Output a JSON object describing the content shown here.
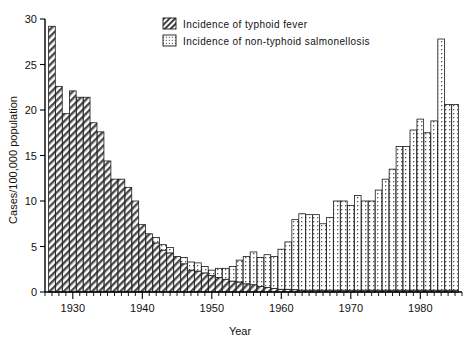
{
  "chart_data": {
    "type": "bar",
    "title": "",
    "subtitle": "",
    "xlabel": "Year",
    "ylabel": "Cases/100,000 population",
    "stacked": true,
    "grid": false,
    "legend_position": "top-center",
    "xlim": [
      1926,
      1986
    ],
    "ylim": [
      0,
      30
    ],
    "ytick_labels": [
      "0",
      "5",
      "10",
      "15",
      "20",
      "25",
      "30"
    ],
    "yticks": [
      0,
      5,
      10,
      15,
      20,
      25,
      30
    ],
    "xtick_labels": [
      "1930",
      "1940",
      "1950",
      "1960",
      "1970",
      "1980"
    ],
    "xticks": [
      1930,
      1940,
      1950,
      1960,
      1970,
      1980
    ],
    "x": [
      1927,
      1928,
      1929,
      1930,
      1931,
      1932,
      1933,
      1934,
      1935,
      1936,
      1937,
      1938,
      1939,
      1940,
      1941,
      1942,
      1943,
      1944,
      1945,
      1946,
      1947,
      1948,
      1949,
      1950,
      1951,
      1952,
      1953,
      1954,
      1955,
      1956,
      1957,
      1958,
      1959,
      1960,
      1961,
      1962,
      1963,
      1964,
      1965,
      1966,
      1967,
      1968,
      1969,
      1970,
      1971,
      1972,
      1973,
      1974,
      1975,
      1976,
      1977,
      1978,
      1979,
      1980,
      1981,
      1982,
      1983,
      1984,
      1985
    ],
    "series": [
      {
        "name": "Incidence of typhoid fever",
        "pattern": "diagonal-hatch",
        "values": [
          29.2,
          22.6,
          19.6,
          22.1,
          21.4,
          21.4,
          18.6,
          17.6,
          14.4,
          12.4,
          12.4,
          11.5,
          10.0,
          7.4,
          6.4,
          5.4,
          4.6,
          4.3,
          3.9,
          3.1,
          2.4,
          2.3,
          2.1,
          1.8,
          1.6,
          1.4,
          1.2,
          1.1,
          0.9,
          0.8,
          0.6,
          0.5,
          0.4,
          0.3,
          0.3,
          0.25,
          0.2,
          0.2,
          0.2,
          0.2,
          0.2,
          0.2,
          0.2,
          0.2,
          0.2,
          0.2,
          0.2,
          0.2,
          0.2,
          0.2,
          0.2,
          0.2,
          0.2,
          0.2,
          0.2,
          0.2,
          0.2,
          0.2,
          0.2
        ]
      },
      {
        "name": "Incidence of non-typhoid salmonellosis",
        "pattern": "dotted",
        "values": [
          0,
          0,
          0,
          0,
          0,
          0,
          0,
          0,
          0,
          0,
          0,
          0,
          0,
          0,
          0,
          0.6,
          0.6,
          0.6,
          0.0,
          0.7,
          0.9,
          0.9,
          0.7,
          0.6,
          1.0,
          1.2,
          1.6,
          2.4,
          3.0,
          3.6,
          3.2,
          3.6,
          3.5,
          4.4,
          5.2,
          7.7,
          8.4,
          8.3,
          8.3,
          7.3,
          8.0,
          9.8,
          9.8,
          9.3,
          10.4,
          9.8,
          9.8,
          11.0,
          12.2,
          13.3,
          15.8,
          15.8,
          17.6,
          18.8,
          17.3,
          18.6,
          27.6,
          20.4,
          20.4
        ]
      }
    ],
    "legend": [
      "Incidence of typhoid fever",
      "Incidence of non-typhoid salmonellosis"
    ]
  }
}
